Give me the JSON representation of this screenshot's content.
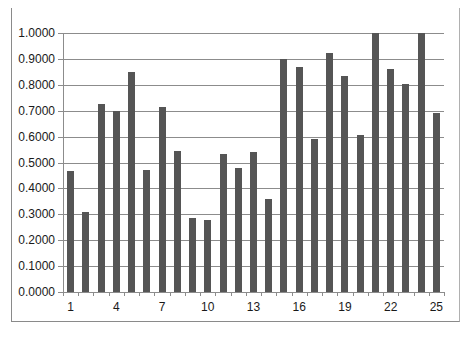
{
  "chart_data": {
    "type": "bar",
    "title": "",
    "xlabel": "",
    "ylabel": "",
    "categories": [
      "1",
      "2",
      "3",
      "4",
      "5",
      "6",
      "7",
      "8",
      "9",
      "10",
      "11",
      "12",
      "13",
      "14",
      "15",
      "16",
      "17",
      "18",
      "19",
      "20",
      "21",
      "22",
      "23",
      "24",
      "25"
    ],
    "values": [
      0.467,
      0.309,
      0.726,
      0.699,
      0.849,
      0.471,
      0.714,
      0.544,
      0.286,
      0.278,
      0.533,
      0.479,
      0.541,
      0.359,
      0.9,
      0.869,
      0.591,
      0.923,
      0.834,
      0.606,
      1.0,
      0.861,
      0.803,
      1.0,
      0.691
    ],
    "ylim": [
      0,
      1
    ],
    "y_ticks": [
      "0.0000",
      "0.1000",
      "0.2000",
      "0.3000",
      "0.4000",
      "0.5000",
      "0.6000",
      "0.7000",
      "0.8000",
      "0.9000",
      "1.0000"
    ],
    "x_tick_labels": [
      "1",
      "4",
      "7",
      "10",
      "13",
      "16",
      "19",
      "22",
      "25"
    ],
    "grid": true,
    "legend": null,
    "bar_color": "#555555",
    "grid_color": "#8c8c8c"
  }
}
